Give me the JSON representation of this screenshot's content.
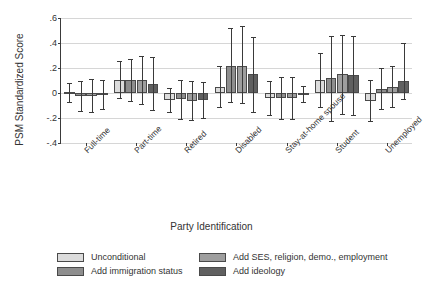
{
  "chart_data": {
    "type": "bar",
    "title": "",
    "xlabel": "Party Identification",
    "ylabel": "PSM Standardized Score",
    "ylim": [
      -0.4,
      0.6
    ],
    "yticks": [
      0.6,
      0.4,
      0.2,
      0,
      -0.2,
      -0.4
    ],
    "ytick_labels": [
      ".6",
      ".4",
      ".2",
      "0",
      "-.2",
      "-.4"
    ],
    "grid": true,
    "legend_position": "below",
    "error_bars": "95% confidence interval",
    "categories": [
      "Full-time",
      "Part-time",
      "Retired",
      "Disabled",
      "Stay-at-home spouse",
      "Student",
      "Unemployed"
    ],
    "series": [
      {
        "name": "Unconditional",
        "color": "#dcdcdc",
        "values": [
          0.005,
          0.105,
          -0.055,
          0.05,
          -0.04,
          0.105,
          -0.06
        ],
        "ci_low": [
          -0.07,
          -0.04,
          -0.15,
          -0.11,
          -0.175,
          -0.11,
          -0.225
        ],
        "ci_high": [
          0.08,
          0.255,
          0.04,
          0.215,
          0.095,
          0.32,
          0.105
        ]
      },
      {
        "name": "Add immigration status",
        "color": "#8e8e8e",
        "values": [
          -0.02,
          0.105,
          -0.05,
          0.22,
          -0.04,
          0.12,
          0.035
        ],
        "ci_low": [
          -0.145,
          -0.065,
          -0.205,
          -0.075,
          -0.205,
          -0.225,
          -0.13
        ],
        "ci_high": [
          0.1,
          0.275,
          0.105,
          0.52,
          0.125,
          0.46,
          0.2
        ]
      },
      {
        "name": "Add SES, religion, demo., employment",
        "color": "#9e9e9e",
        "values": [
          -0.02,
          0.105,
          -0.06,
          0.22,
          -0.04,
          0.15,
          0.05
        ],
        "ci_low": [
          -0.155,
          -0.09,
          -0.215,
          -0.08,
          -0.21,
          -0.165,
          -0.115
        ],
        "ci_high": [
          0.115,
          0.3,
          0.1,
          0.54,
          0.13,
          0.465,
          0.215
        ]
      },
      {
        "name": "Add ideology",
        "color": "#606060",
        "values": [
          -0.015,
          0.075,
          -0.055,
          0.15,
          -0.005,
          0.145,
          0.1
        ],
        "ci_low": [
          -0.13,
          -0.135,
          -0.2,
          -0.15,
          -0.07,
          -0.175,
          -0.05
        ],
        "ci_high": [
          0.105,
          0.29,
          0.09,
          0.45,
          0.06,
          0.46,
          0.4
        ]
      }
    ]
  },
  "legend": {
    "items": [
      "Unconditional",
      "Add immigration status",
      "Add SES, religion, demo., employment",
      "Add ideology"
    ]
  }
}
